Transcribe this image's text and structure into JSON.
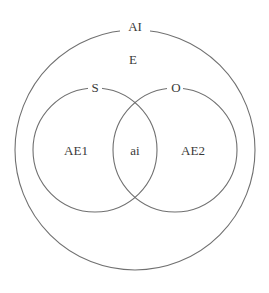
{
  "diagram": {
    "type": "venn",
    "outer": {
      "label": "AI",
      "region_label": "E"
    },
    "left_set": {
      "label": "S",
      "region_label": "AE1"
    },
    "right_set": {
      "label": "O",
      "region_label": "AE2"
    },
    "intersection": {
      "region_label": "ai"
    },
    "colors": {
      "stroke": "#707070",
      "text": "#3a3a3a",
      "background": "#ffffff"
    }
  }
}
